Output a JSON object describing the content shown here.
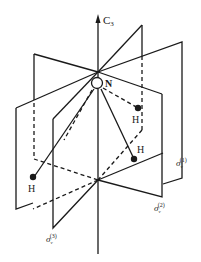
{
  "figure": {
    "axis": {
      "label": "C",
      "subscript": "3"
    },
    "central_atom": {
      "label": "N"
    },
    "ligands": [
      {
        "label": "H"
      },
      {
        "label": "H"
      },
      {
        "label": "H"
      }
    ],
    "planes": [
      {
        "label": "σ",
        "subscript": "v",
        "superscript": "(1)"
      },
      {
        "label": "σ",
        "subscript": "v",
        "superscript": "(2)"
      },
      {
        "label": "σ",
        "subscript": "v",
        "superscript": "(3)"
      }
    ],
    "colors": {
      "ink": "#1a1a1a",
      "background": "#ffffff"
    }
  }
}
